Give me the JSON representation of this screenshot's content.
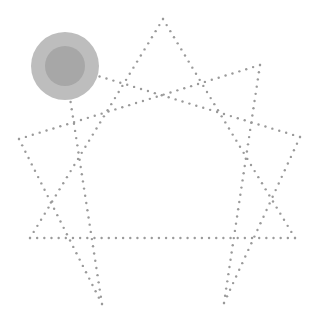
{
  "diagram": {
    "type": "enneagram",
    "background": "#ffffff",
    "line_color": "#9a9a9a",
    "dot_spacing": 7.2,
    "dot_radius": 1.2,
    "points": {
      "9": [
        163,
        19
      ],
      "1": [
        260,
        65
      ],
      "2": [
        300,
        137
      ],
      "3": [
        295,
        238
      ],
      "4": [
        224,
        303
      ],
      "5": [
        102,
        304
      ],
      "6": [
        30,
        238
      ],
      "7": [
        19,
        139
      ],
      "8": [
        65,
        66
      ]
    },
    "triangle": [
      "9",
      "3",
      "6"
    ],
    "hexad": [
      "1",
      "4",
      "2",
      "8",
      "5",
      "7"
    ],
    "marker": {
      "point": "8",
      "outer_radius": 34,
      "inner_radius": 20,
      "outer_color": "#bdbdbd",
      "inner_color": "#a7a7a7"
    }
  }
}
